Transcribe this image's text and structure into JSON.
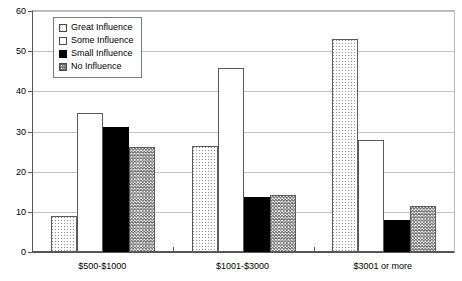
{
  "chart_data": {
    "type": "bar",
    "title": "",
    "subtitle": "",
    "xlabel": "",
    "ylabel": "",
    "ylim": [
      0,
      60
    ],
    "ytick_step": 10,
    "yticks": [
      "0",
      "10",
      "20",
      "30",
      "40",
      "50",
      "60"
    ],
    "grid": true,
    "legend_position": "upper-left-inside",
    "categories": [
      "$500-$1000",
      "$1001-$3000",
      "$3001 or more"
    ],
    "series": [
      {
        "name": "Great Influence",
        "pattern": "dotted",
        "color": "#ffffff",
        "values": [
          9,
          26.5,
          53
        ]
      },
      {
        "name": "Some Influence",
        "pattern": "white",
        "color": "#ffffff",
        "values": [
          34.7,
          45.7,
          27.8
        ]
      },
      {
        "name": "Small Influence",
        "pattern": "solid-black",
        "color": "#000000",
        "values": [
          31,
          13.8,
          8
        ]
      },
      {
        "name": "No Influence",
        "pattern": "crosshatch",
        "color": "#808080",
        "values": [
          26.1,
          14.3,
          11.5
        ]
      }
    ]
  },
  "legend": {
    "items": [
      {
        "label": "Great Influence",
        "pattern": "dotted"
      },
      {
        "label": "Some Influence",
        "pattern": "white"
      },
      {
        "label": "Small Influence",
        "pattern": "solid-black"
      },
      {
        "label": "No Influence",
        "pattern": "crosshatch"
      }
    ]
  }
}
